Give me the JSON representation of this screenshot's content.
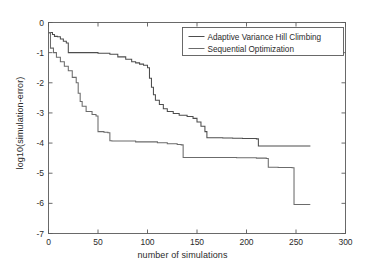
{
  "chart_data": {
    "type": "line",
    "title": "",
    "xlabel": "number of simulations",
    "ylabel": "log10(simulation-error)",
    "xlim": [
      0,
      300
    ],
    "ylim": [
      -7,
      0
    ],
    "xticks": [
      0,
      50,
      100,
      150,
      200,
      250,
      300
    ],
    "yticks": [
      0,
      -1,
      -2,
      -3,
      -4,
      -5,
      -6,
      -7
    ],
    "xticklabels": [
      "0",
      "50",
      "100",
      "150",
      "200",
      "250",
      "300"
    ],
    "yticklabels": [
      "0",
      "-1",
      "-2",
      "-3",
      "-4",
      "-5",
      "-6",
      "-7"
    ],
    "grid": false,
    "legend_position": "upper right",
    "line_color": "#4d4d4d",
    "axis_color": "#5a5a5a",
    "text_color": "#2b2b2b",
    "drawstyle": "steps-post",
    "series": [
      {
        "name": "Adaptive Variance Hill Climbing",
        "color": "#4d4d4d",
        "x": [
          0,
          2,
          4,
          6,
          9,
          12,
          15,
          18,
          20,
          50,
          62,
          70,
          78,
          84,
          88,
          92,
          96,
          100,
          102,
          104,
          106,
          108,
          112,
          116,
          120,
          126,
          132,
          140,
          146,
          150,
          154,
          158,
          160,
          176,
          186,
          196,
          210,
          212,
          264
        ],
        "y": [
          -0.34,
          -0.33,
          -0.4,
          -0.46,
          -0.47,
          -0.55,
          -0.62,
          -0.68,
          -1.0,
          -1.02,
          -1.05,
          -1.14,
          -1.22,
          -1.3,
          -1.34,
          -1.38,
          -1.42,
          -1.5,
          -1.85,
          -2.15,
          -2.4,
          -2.58,
          -2.72,
          -2.86,
          -2.95,
          -3.02,
          -3.08,
          -3.12,
          -3.18,
          -3.3,
          -3.44,
          -3.62,
          -3.82,
          -3.83,
          -3.84,
          -3.85,
          -3.86,
          -4.1,
          -4.11
        ]
      },
      {
        "name": "Sequential Optimization",
        "color": "#6b6b6b",
        "x": [
          0,
          2,
          5,
          8,
          12,
          16,
          20,
          24,
          28,
          30,
          32,
          34,
          38,
          44,
          48,
          50,
          56,
          60,
          62,
          64,
          88,
          110,
          120,
          130,
          134,
          136,
          190,
          210,
          220,
          222,
          232,
          246,
          248,
          264
        ],
        "y": [
          -0.34,
          -0.85,
          -1.0,
          -1.15,
          -1.3,
          -1.45,
          -1.6,
          -1.82,
          -2.0,
          -2.35,
          -2.62,
          -2.78,
          -2.95,
          -3.05,
          -3.1,
          -3.62,
          -3.64,
          -3.66,
          -3.92,
          -3.93,
          -3.96,
          -3.99,
          -4.02,
          -4.05,
          -4.06,
          -4.48,
          -4.49,
          -4.5,
          -4.51,
          -4.8,
          -4.81,
          -4.82,
          -6.04,
          -6.05
        ]
      }
    ]
  },
  "legend": {
    "items": [
      {
        "label": "Adaptive Variance Hill Climbing"
      },
      {
        "label": "Sequential Optimization"
      }
    ]
  }
}
